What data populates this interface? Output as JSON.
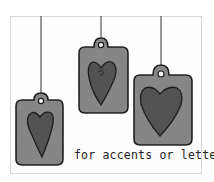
{
  "illustration": {
    "caption": "for accents or letters",
    "colors": {
      "background": "#ffffff",
      "tag_fill": "#8a8a8a",
      "heart_fill": "#555555",
      "outline": "#1e1e1e",
      "string": "#333333",
      "card_border": "#d8d8d8"
    },
    "tags": [
      {
        "name": "left",
        "shape": "heart-tag"
      },
      {
        "name": "middle",
        "shape": "heart-tag"
      },
      {
        "name": "right",
        "shape": "heart-tag"
      }
    ]
  }
}
